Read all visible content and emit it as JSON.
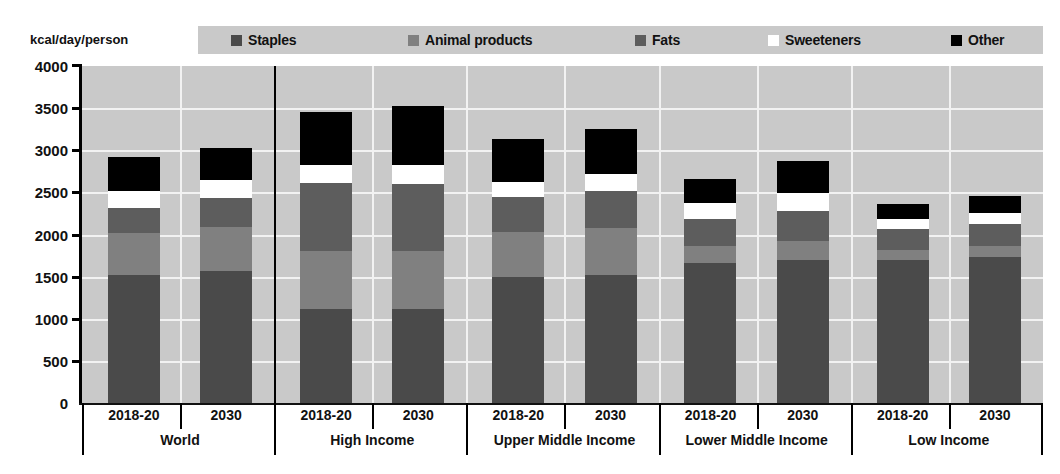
{
  "axis_title": "kcal/day/person",
  "colors": {
    "staples": "#4a4a4a",
    "animal_products": "#808080",
    "fats": "#5d5d5d",
    "sweeteners": "#ffffff",
    "other": "#000000",
    "plot_background": "#c9c9c9",
    "gridline": "#f2f2f2",
    "axis": "#000000"
  },
  "legend": {
    "items": [
      {
        "label": "Staples",
        "color": "#4a4a4a",
        "x": 33
      },
      {
        "label": "Animal products",
        "color": "#808080",
        "x": 210
      },
      {
        "label": "Fats",
        "color": "#5d5d5d",
        "x": 437
      },
      {
        "label": "Sweeteners",
        "color": "#ffffff",
        "x": 570
      },
      {
        "label": "Other",
        "color": "#000000",
        "x": 753
      }
    ]
  },
  "chart_data": {
    "type": "bar",
    "title": "",
    "subtitle": "",
    "xlabel": "",
    "ylabel": "kcal/day/person",
    "ylim": [
      0,
      4000
    ],
    "yticks": [
      0,
      500,
      1000,
      1500,
      2000,
      2500,
      3000,
      3500,
      4000
    ],
    "grid": true,
    "stacked": true,
    "legend_position": "top",
    "series": [
      {
        "name": "Staples",
        "color": "#4a4a4a",
        "values": [
          1520,
          1570,
          1110,
          1110,
          1490,
          1520,
          1660,
          1700,
          1700,
          1730
        ]
      },
      {
        "name": "Animal products",
        "color": "#808080",
        "values": [
          500,
          520,
          700,
          690,
          540,
          560,
          200,
          220,
          120,
          130
        ]
      },
      {
        "name": "Fats",
        "color": "#5d5d5d",
        "values": [
          290,
          340,
          800,
          800,
          410,
          440,
          320,
          360,
          240,
          270
        ]
      },
      {
        "name": "Sweeteners",
        "color": "#ffffff",
        "values": [
          210,
          220,
          220,
          230,
          180,
          200,
          190,
          210,
          120,
          130
        ]
      },
      {
        "name": "Other",
        "color": "#000000",
        "values": [
          400,
          380,
          630,
          690,
          510,
          530,
          290,
          380,
          180,
          200
        ]
      }
    ],
    "groups": [
      {
        "label": "World",
        "periods": [
          "2018-20",
          "2030"
        ],
        "totals": [
          2920,
          3030
        ]
      },
      {
        "label": "High Income",
        "periods": [
          "2018-20",
          "2030"
        ],
        "totals": [
          3460,
          3520
        ]
      },
      {
        "label": "Upper Middle Income",
        "periods": [
          "2018-20",
          "2030"
        ],
        "totals": [
          3130,
          3250
        ]
      },
      {
        "label": "Lower Middle Income",
        "periods": [
          "2018-20",
          "2030"
        ],
        "totals": [
          2660,
          2870
        ]
      },
      {
        "label": "Low Income",
        "periods": [
          "2018-20",
          "2030"
        ],
        "totals": [
          2360,
          2460
        ]
      }
    ],
    "categories": [
      "World 2018-20",
      "World 2030",
      "High Income 2018-20",
      "High Income 2030",
      "Upper Middle Income 2018-20",
      "Upper Middle Income 2030",
      "Lower Middle Income 2018-20",
      "Lower Middle Income 2030",
      "Low Income 2018-20",
      "Low Income 2030"
    ]
  }
}
